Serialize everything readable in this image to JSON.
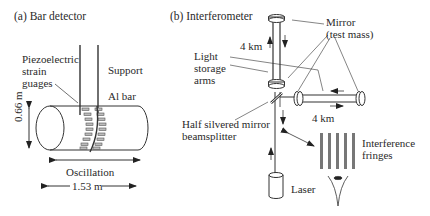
{
  "panel_a": {
    "heading": "(a)   Bar detector",
    "labels": {
      "strain_gauges": "Piezoelectric\nstrain\nguages",
      "support": "Support",
      "al_bar": "Al bar",
      "height": "0.66 m",
      "oscillation": "Oscillation",
      "length": "1.53 m"
    }
  },
  "panel_b": {
    "heading": "(b)  Interferometer",
    "labels": {
      "mirror": "Mirror\n(test mass)",
      "arm_vertical": "4 km",
      "light_storage": "Light\nstorage\narms",
      "beamsplitter": "Half silvered mirror\nbeamsplitter",
      "arm_horizontal": "4 km",
      "fringes": "Interference\nfringes",
      "laser": "Laser"
    }
  },
  "colors": {
    "line": "#333333",
    "fringe": "#777777",
    "text": "#2a2a2a"
  }
}
